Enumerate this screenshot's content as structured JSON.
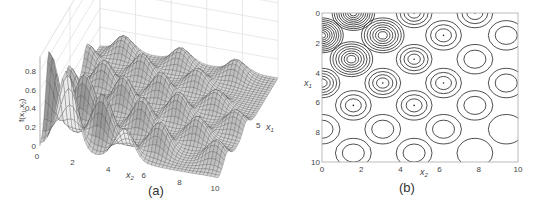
{
  "figure": {
    "panels": [
      {
        "id": "a",
        "caption": "(a)"
      },
      {
        "id": "b",
        "caption": "(b)"
      }
    ]
  },
  "chart_data": [
    {
      "type": "surface",
      "panel": "(a)",
      "title": "",
      "zlabel": "f(x1,x2)",
      "xlabel": "x2",
      "ylabel": "x1",
      "z_ticks": [
        "0",
        "0.2",
        "0.4",
        "0.6",
        "0.8"
      ],
      "x2_ticks": [
        "0",
        "2",
        "4",
        "6",
        "8",
        "10"
      ],
      "x1_ticks": [
        "5",
        "10"
      ],
      "zlim": [
        0,
        0.8
      ],
      "x2_range": [
        0,
        10
      ],
      "x1_range": [
        0,
        10
      ],
      "grid": true,
      "colormap": "gray mesh",
      "description": "Periodic grid of Gaussian-like bumps; two tallest peaks (~0.8-0.9) near x1≈0-2, x2≈0-2, smaller bumps (~0.2-0.4) across the domain decaying in amplitude away from origin",
      "peaks": [
        {
          "x1": 1.5,
          "x2": 0.0,
          "z": 0.85
        },
        {
          "x1": 0.0,
          "x2": 1.5,
          "z": 0.85
        },
        {
          "x1": 3.0,
          "x2": 1.5,
          "z": 0.5
        },
        {
          "x1": 1.5,
          "x2": 3.0,
          "z": 0.5
        },
        {
          "x1": 4.7,
          "x2": 0.0,
          "z": 0.35
        },
        {
          "x1": 0.0,
          "x2": 4.7,
          "z": 0.35
        },
        {
          "x1": 4.7,
          "x2": 3.1,
          "z": 0.35
        },
        {
          "x1": 3.1,
          "x2": 4.7,
          "z": 0.35
        },
        {
          "x1": 6.2,
          "x2": 1.5,
          "z": 0.3
        },
        {
          "x1": 1.5,
          "x2": 6.2,
          "z": 0.3
        },
        {
          "x1": 6.2,
          "x2": 4.7,
          "z": 0.28
        },
        {
          "x1": 4.7,
          "x2": 6.2,
          "z": 0.28
        },
        {
          "x1": 7.8,
          "x2": 0.0,
          "z": 0.25
        },
        {
          "x1": 7.8,
          "x2": 3.1,
          "z": 0.25
        },
        {
          "x1": 3.1,
          "x2": 7.8,
          "z": 0.25
        },
        {
          "x1": 9.4,
          "x2": 1.5,
          "z": 0.22
        },
        {
          "x1": 1.5,
          "x2": 9.4,
          "z": 0.22
        },
        {
          "x1": 9.4,
          "x2": 4.7,
          "z": 0.2
        },
        {
          "x1": 4.7,
          "x2": 9.4,
          "z": 0.2
        },
        {
          "x1": 7.8,
          "x2": 6.2,
          "z": 0.2
        },
        {
          "x1": 6.2,
          "x2": 7.8,
          "z": 0.2
        },
        {
          "x1": 9.4,
          "x2": 7.8,
          "z": 0.18
        }
      ]
    },
    {
      "type": "contour",
      "panel": "(b)",
      "title": "",
      "xlabel": "x2",
      "ylabel": "x1",
      "x_ticks": [
        "0",
        "2",
        "4",
        "6",
        "8",
        "10"
      ],
      "y_ticks": [
        "0",
        "2",
        "4",
        "6",
        "8",
        "10"
      ],
      "xlim": [
        0,
        10
      ],
      "ylim": [
        10,
        0
      ],
      "y_axis_inverted": true,
      "grid": false,
      "line_color": "#222222",
      "contour_centers": [
        {
          "x2": 1.6,
          "x1": 0.0,
          "rings": 9,
          "note": "dense, clipped at top edge"
        },
        {
          "x2": 0.0,
          "x1": 1.5,
          "rings": 9,
          "note": "dense, clipped at left edge"
        },
        {
          "x2": 4.7,
          "x1": 0.0,
          "rings": 4,
          "note": "clipped at top edge"
        },
        {
          "x2": 7.8,
          "x1": 0.0,
          "rings": 3,
          "note": "clipped at top edge"
        },
        {
          "x2": 3.1,
          "x1": 1.5,
          "rings": 7
        },
        {
          "x2": 6.2,
          "x1": 1.5,
          "rings": 3
        },
        {
          "x2": 9.4,
          "x1": 1.5,
          "rings": 2
        },
        {
          "x2": 1.5,
          "x1": 3.1,
          "rings": 7
        },
        {
          "x2": 4.7,
          "x1": 3.1,
          "rings": 4
        },
        {
          "x2": 7.8,
          "x1": 3.1,
          "rings": 2
        },
        {
          "x2": 0.0,
          "x1": 4.7,
          "rings": 5,
          "note": "clipped at left edge"
        },
        {
          "x2": 3.1,
          "x1": 4.7,
          "rings": 4
        },
        {
          "x2": 6.2,
          "x1": 4.7,
          "rings": 3
        },
        {
          "x2": 9.4,
          "x1": 4.7,
          "rings": 2
        },
        {
          "x2": 1.6,
          "x1": 6.2,
          "rings": 3
        },
        {
          "x2": 4.7,
          "x1": 6.2,
          "rings": 3
        },
        {
          "x2": 7.8,
          "x1": 6.2,
          "rings": 2
        },
        {
          "x2": 0.0,
          "x1": 7.8,
          "rings": 2,
          "note": "clipped at left edge"
        },
        {
          "x2": 3.1,
          "x1": 7.8,
          "rings": 2
        },
        {
          "x2": 6.2,
          "x1": 7.8,
          "rings": 2
        },
        {
          "x2": 9.4,
          "x1": 7.8,
          "rings": 1
        },
        {
          "x2": 1.6,
          "x1": 9.4,
          "rings": 2
        },
        {
          "x2": 4.7,
          "x1": 9.4,
          "rings": 2
        },
        {
          "x2": 7.8,
          "x1": 9.4,
          "rings": 1
        }
      ]
    }
  ]
}
